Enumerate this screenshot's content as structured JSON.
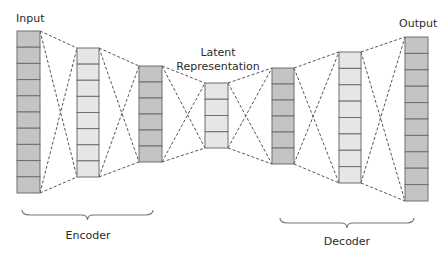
{
  "diagram": {
    "labels": {
      "input": "Input",
      "output": "Output",
      "latent_line1": "Latent",
      "latent_line2": "Representation",
      "encoder": "Encoder",
      "decoder": "Decoder"
    },
    "colors": {
      "dark_fill": "#c4c4c4",
      "light_fill": "#e6e6e6",
      "cell_border": "#6e6e6e",
      "connector": "#555555",
      "brace": "#777777"
    },
    "layers": [
      {
        "name": "input",
        "x": 17,
        "y": 31,
        "w": 23,
        "h": 162,
        "cells": 10,
        "shade": "dark"
      },
      {
        "name": "encoder-hidden-1",
        "x": 77,
        "y": 48,
        "w": 22,
        "h": 129,
        "cells": 8,
        "shade": "light"
      },
      {
        "name": "encoder-hidden-2",
        "x": 139,
        "y": 66,
        "w": 23,
        "h": 96,
        "cells": 6,
        "shade": "dark"
      },
      {
        "name": "latent",
        "x": 205,
        "y": 83,
        "w": 23,
        "h": 65,
        "cells": 4,
        "shade": "light"
      },
      {
        "name": "decoder-hidden-1",
        "x": 272,
        "y": 68,
        "w": 22,
        "h": 96,
        "cells": 6,
        "shade": "dark"
      },
      {
        "name": "decoder-hidden-2",
        "x": 339,
        "y": 52,
        "w": 22,
        "h": 131,
        "cells": 8,
        "shade": "light"
      },
      {
        "name": "output",
        "x": 405,
        "y": 37,
        "w": 23,
        "h": 164,
        "cells": 10,
        "shade": "dark"
      }
    ],
    "braces": [
      {
        "name": "encoder",
        "x1": 22,
        "x2": 153,
        "y": 210
      },
      {
        "name": "decoder",
        "x1": 280,
        "x2": 414,
        "y": 218
      }
    ]
  }
}
